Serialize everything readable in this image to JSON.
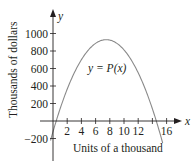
{
  "chart_data": {
    "type": "line",
    "title": "",
    "xlabel": "Units of a thousand",
    "ylabel": "Thousands of dollars",
    "x_axis_symbol": "x",
    "y_axis_symbol": "y",
    "curve_label": "y = P(x)",
    "x_ticks": [
      2,
      4,
      6,
      8,
      10,
      12,
      14,
      16
    ],
    "x_tick_labels": [
      "2",
      "4",
      "6",
      "8",
      "10",
      "12",
      "",
      "16"
    ],
    "y_ticks": [
      -200,
      200,
      400,
      600,
      800,
      1000
    ],
    "y_tick_labels": [
      "−200",
      "200",
      "400",
      "600",
      "800",
      "1000"
    ],
    "xlim": [
      0,
      17
    ],
    "ylim": [
      -300,
      1100
    ],
    "grid": false,
    "legend": "none",
    "series": [
      {
        "name": "P(x)",
        "description": "downward parabola with roots near x=0.45 and x=14.55, maximum about 930 at x=7.5",
        "x": [
          -0.3,
          0,
          0.45,
          2,
          4,
          6,
          7.5,
          9,
          11,
          13,
          14.55,
          15.5
        ],
        "y": [
          -325,
          -122,
          0,
          465,
          810,
          970,
          930,
          885,
          625,
          280,
          0,
          -255
        ]
      }
    ],
    "colors": {
      "axis": "#231f20",
      "curve": "#8a8a8a"
    }
  }
}
